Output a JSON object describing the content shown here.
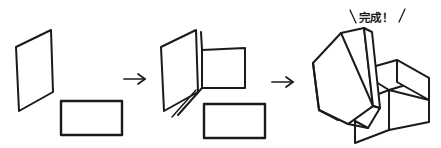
{
  "illustration": {
    "title": "Box assembly instruction sequence",
    "style": "hand-drawn line art",
    "background_color": "#ffffff",
    "ink_color": "#1a1a1a",
    "step_count": 3
  },
  "caption": {
    "text": "完成！",
    "meaning": "Complete!",
    "left_slash": "\\",
    "right_slash": "/"
  },
  "steps": [
    {
      "index": 1,
      "name": "flat-pieces",
      "description": "Two separate flat pieces: an upright parallelogram panel and a horizontal rectangle panel",
      "parts": [
        "parallelogram-panel",
        "rectangle-panel"
      ]
    },
    {
      "index": 2,
      "name": "partially-folded",
      "description": "Parallelogram panel with a folded side flap forming a corner, rectangle panel still flat",
      "parts": [
        "parallelogram-panel",
        "folded-flap",
        "fold-crease",
        "rectangle-panel"
      ]
    },
    {
      "index": 3,
      "name": "assembled-box",
      "description": "Finished open box with its lid leaning against the left side",
      "parts": [
        "box-body",
        "box-lid"
      ]
    }
  ],
  "arrows": [
    {
      "index": 1,
      "name": "step-1-to-2-arrow",
      "direction": "right"
    },
    {
      "index": 2,
      "name": "step-2-to-3-arrow",
      "direction": "right"
    }
  ]
}
